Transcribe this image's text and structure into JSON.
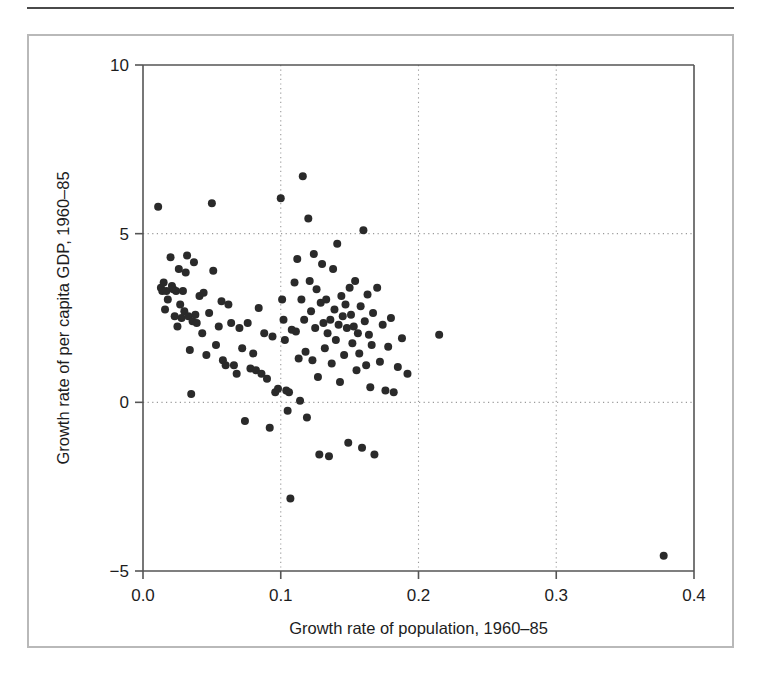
{
  "figure": {
    "background_color": "#ffffff",
    "frame_color": "#b9b9b9",
    "rule_color": "#4a4a4a",
    "point_color": "#2a2a2a",
    "axis_color": "#555555",
    "grid_color": "#9a9a9a"
  },
  "axes": {
    "x_title": "Growth rate of population, 1960–85",
    "y_title": "Growth rate of per capita GDP, 1960–85",
    "x_ticks": [
      "0.0",
      "0.1",
      "0.2",
      "0.3",
      "0.4"
    ],
    "y_ticks": [
      "−5",
      "0",
      "5",
      "10"
    ]
  },
  "chart_data": {
    "type": "scatter",
    "title": "",
    "xlabel": "Growth rate of population, 1960–85",
    "ylabel": "Growth rate of per capita GDP, 1960–85",
    "xlim": [
      0.0,
      0.4
    ],
    "ylim": [
      -5,
      10
    ],
    "xticks": [
      0.0,
      0.1,
      0.2,
      0.3,
      0.4
    ],
    "yticks": [
      -5,
      0,
      5,
      10
    ],
    "grid": true,
    "grid_style": "dotted",
    "legend": null,
    "marker": "filled-circle",
    "marker_size_px": 8,
    "series": [
      {
        "name": "Countries",
        "points": [
          [
            0.011,
            5.8
          ],
          [
            0.013,
            3.4
          ],
          [
            0.014,
            3.3
          ],
          [
            0.015,
            3.55
          ],
          [
            0.016,
            2.75
          ],
          [
            0.017,
            3.3
          ],
          [
            0.018,
            3.05
          ],
          [
            0.02,
            4.3
          ],
          [
            0.021,
            3.45
          ],
          [
            0.022,
            3.35
          ],
          [
            0.023,
            2.55
          ],
          [
            0.024,
            3.3
          ],
          [
            0.025,
            2.25
          ],
          [
            0.026,
            3.95
          ],
          [
            0.027,
            2.9
          ],
          [
            0.028,
            2.5
          ],
          [
            0.029,
            3.3
          ],
          [
            0.03,
            2.7
          ],
          [
            0.031,
            3.85
          ],
          [
            0.032,
            4.35
          ],
          [
            0.033,
            2.55
          ],
          [
            0.034,
            1.55
          ],
          [
            0.035,
            0.25
          ],
          [
            0.036,
            2.4
          ],
          [
            0.037,
            4.15
          ],
          [
            0.038,
            2.6
          ],
          [
            0.039,
            2.35
          ],
          [
            0.041,
            3.15
          ],
          [
            0.043,
            2.05
          ],
          [
            0.044,
            3.25
          ],
          [
            0.046,
            1.4
          ],
          [
            0.048,
            2.65
          ],
          [
            0.05,
            5.9
          ],
          [
            0.051,
            3.9
          ],
          [
            0.053,
            1.7
          ],
          [
            0.055,
            2.25
          ],
          [
            0.057,
            3.0
          ],
          [
            0.058,
            1.25
          ],
          [
            0.06,
            1.1
          ],
          [
            0.062,
            2.9
          ],
          [
            0.064,
            2.35
          ],
          [
            0.066,
            1.1
          ],
          [
            0.068,
            0.85
          ],
          [
            0.07,
            2.2
          ],
          [
            0.072,
            1.6
          ],
          [
            0.074,
            -0.55
          ],
          [
            0.076,
            2.35
          ],
          [
            0.078,
            1.0
          ],
          [
            0.08,
            1.45
          ],
          [
            0.082,
            0.95
          ],
          [
            0.084,
            2.8
          ],
          [
            0.086,
            0.85
          ],
          [
            0.088,
            2.05
          ],
          [
            0.09,
            0.7
          ],
          [
            0.092,
            -0.75
          ],
          [
            0.094,
            1.95
          ],
          [
            0.096,
            0.3
          ],
          [
            0.098,
            0.4
          ],
          [
            0.1,
            6.05
          ],
          [
            0.101,
            3.05
          ],
          [
            0.102,
            2.45
          ],
          [
            0.103,
            1.85
          ],
          [
            0.104,
            0.35
          ],
          [
            0.105,
            -0.25
          ],
          [
            0.106,
            0.3
          ],
          [
            0.107,
            -2.85
          ],
          [
            0.108,
            2.15
          ],
          [
            0.11,
            3.55
          ],
          [
            0.111,
            2.1
          ],
          [
            0.112,
            4.25
          ],
          [
            0.113,
            1.3
          ],
          [
            0.114,
            0.05
          ],
          [
            0.115,
            3.05
          ],
          [
            0.116,
            6.7
          ],
          [
            0.117,
            2.45
          ],
          [
            0.118,
            1.5
          ],
          [
            0.119,
            -0.45
          ],
          [
            0.12,
            5.45
          ],
          [
            0.121,
            3.6
          ],
          [
            0.122,
            2.7
          ],
          [
            0.123,
            1.25
          ],
          [
            0.124,
            4.4
          ],
          [
            0.125,
            2.2
          ],
          [
            0.126,
            3.35
          ],
          [
            0.127,
            0.75
          ],
          [
            0.128,
            -1.55
          ],
          [
            0.129,
            2.95
          ],
          [
            0.13,
            4.1
          ],
          [
            0.131,
            2.35
          ],
          [
            0.132,
            1.6
          ],
          [
            0.133,
            3.05
          ],
          [
            0.134,
            2.05
          ],
          [
            0.135,
            -1.6
          ],
          [
            0.136,
            2.45
          ],
          [
            0.137,
            1.15
          ],
          [
            0.138,
            3.95
          ],
          [
            0.139,
            2.75
          ],
          [
            0.14,
            1.85
          ],
          [
            0.141,
            4.7
          ],
          [
            0.142,
            2.3
          ],
          [
            0.143,
            0.6
          ],
          [
            0.144,
            3.15
          ],
          [
            0.145,
            2.55
          ],
          [
            0.146,
            1.4
          ],
          [
            0.147,
            2.9
          ],
          [
            0.148,
            2.2
          ],
          [
            0.149,
            -1.2
          ],
          [
            0.15,
            3.4
          ],
          [
            0.151,
            2.6
          ],
          [
            0.152,
            1.75
          ],
          [
            0.153,
            2.25
          ],
          [
            0.154,
            3.6
          ],
          [
            0.155,
            0.95
          ],
          [
            0.156,
            2.05
          ],
          [
            0.157,
            1.45
          ],
          [
            0.158,
            2.85
          ],
          [
            0.159,
            -1.35
          ],
          [
            0.16,
            5.1
          ],
          [
            0.161,
            2.4
          ],
          [
            0.162,
            1.1
          ],
          [
            0.163,
            3.2
          ],
          [
            0.164,
            2.0
          ],
          [
            0.165,
            0.45
          ],
          [
            0.166,
            1.7
          ],
          [
            0.167,
            2.65
          ],
          [
            0.168,
            -1.55
          ],
          [
            0.17,
            3.4
          ],
          [
            0.172,
            1.2
          ],
          [
            0.174,
            2.3
          ],
          [
            0.176,
            0.35
          ],
          [
            0.178,
            1.65
          ],
          [
            0.18,
            2.5
          ],
          [
            0.182,
            0.3
          ],
          [
            0.185,
            1.05
          ],
          [
            0.188,
            1.9
          ],
          [
            0.192,
            0.85
          ],
          [
            0.215,
            2.0
          ],
          [
            0.378,
            -4.55
          ]
        ]
      }
    ]
  }
}
